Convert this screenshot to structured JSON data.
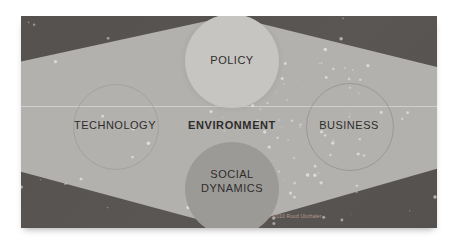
{
  "diagram": {
    "center_label": "ENVIRONMENT",
    "nodes": [
      {
        "id": "policy",
        "position": "top",
        "label": "POLICY"
      },
      {
        "id": "technology",
        "position": "left",
        "label": "TECHNOLOGY"
      },
      {
        "id": "business",
        "position": "right",
        "label": "BUSINESS"
      },
      {
        "id": "social-dynamics",
        "position": "bottom",
        "label": "SOCIAL DYNAMICS"
      }
    ],
    "copyright": "© 2010 Ruud Uluthaler"
  },
  "colors": {
    "bg-dark": "#55514e",
    "hex-fill": "#b3b1ae",
    "circle-light": "#c7c5c2",
    "circle-dark": "#9c9a97",
    "label-color": "#2e2c2a",
    "copyright-color": "#b59a8d"
  }
}
